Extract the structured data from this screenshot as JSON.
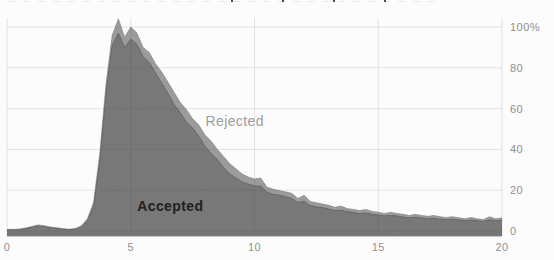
{
  "chart_data": {
    "type": "area",
    "stacked": true,
    "xlim": [
      0,
      20
    ],
    "ylim": [
      -2.5,
      108
    ],
    "y_unit": "%",
    "grid": true,
    "y_axis_side": "right",
    "x_start": 0,
    "x_step": 0.25,
    "x_ticks": [
      0,
      5,
      10,
      15,
      20
    ],
    "x_tick_labels": [
      "0",
      "5",
      "10",
      "15",
      "20"
    ],
    "y_ticks": [
      100,
      80,
      60,
      40,
      20,
      0
    ],
    "y_tick_labels": [
      "100%",
      "80",
      "60",
      "40",
      "20",
      "0"
    ],
    "colors": {
      "accepted_fill": "#9a9a9a",
      "accepted_edge": "#858585",
      "rejected_fill": "#c7c7c7",
      "rejected_edge": "#b0b0b0",
      "gridline": "rgba(80,80,80,0.14)",
      "axis_line": "#c6c6c6",
      "tick_text": "#8f8f8f",
      "background": "#fcfcfc"
    },
    "series": [
      {
        "name": "Accepted",
        "values": [
          0.6,
          0.6,
          0.7,
          1.2,
          1.8,
          2.5,
          2.2,
          1.6,
          1.3,
          0.9,
          0.7,
          0.9,
          2.0,
          5.0,
          12,
          34.5,
          67.5,
          91,
          97,
          90,
          94,
          91.5,
          85.5,
          82.5,
          77.5,
          72.5,
          67.5,
          62,
          58,
          53.5,
          50.5,
          46.5,
          41.5,
          38,
          35,
          31,
          28,
          26,
          24,
          23,
          22,
          22,
          19,
          18,
          17.6,
          16.8,
          16,
          14,
          14.5,
          12.5,
          11.8,
          11.4,
          10.8,
          10,
          10.2,
          9.5,
          9,
          8.6,
          8.8,
          8.2,
          7.8,
          7.4,
          7.6,
          7.4,
          6.8,
          6.4,
          6.7,
          6.4,
          6.0,
          6.2,
          5.8,
          5.6,
          5.7,
          5.5,
          5.0,
          5.4,
          5.0,
          4.7,
          5.5,
          5.0,
          5.3
        ]
      },
      {
        "name": "Rejected",
        "values": [
          0.2,
          0.2,
          0.3,
          0.3,
          0.4,
          0.5,
          0.4,
          0.4,
          0.3,
          0.3,
          0.2,
          0.3,
          0.5,
          1.0,
          2.0,
          3.5,
          4.5,
          5.0,
          7.0,
          5.0,
          6.0,
          5.5,
          4.5,
          5.0,
          4.5,
          5.5,
          5.5,
          6.0,
          5.0,
          6.0,
          4.5,
          5.5,
          5.5,
          6.0,
          5.0,
          5.5,
          5.0,
          4.5,
          4.0,
          3.5,
          3.5,
          4.0,
          2.5,
          2.5,
          2.2,
          2.4,
          2.5,
          2.0,
          3.0,
          2.0,
          2.0,
          1.8,
          1.8,
          1.6,
          2.0,
          1.5,
          1.6,
          1.4,
          1.8,
          1.4,
          1.4,
          1.2,
          1.6,
          1.2,
          1.4,
          1.2,
          1.5,
          1.2,
          1.2,
          1.4,
          1.2,
          1.0,
          1.3,
          1.0,
          1.0,
          1.2,
          1.0,
          0.9,
          1.5,
          1.0,
          1.2
        ]
      }
    ],
    "annotations": [
      {
        "text": "Rejected",
        "x": 9.2,
        "y": 54
      },
      {
        "text": "Accepted",
        "x": 6.6,
        "y": 12.5
      }
    ]
  }
}
